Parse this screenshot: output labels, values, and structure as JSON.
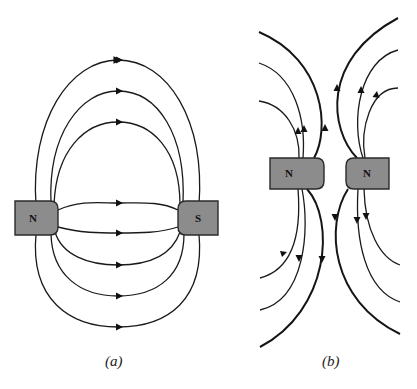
{
  "figure": {
    "panels": [
      {
        "id": "a",
        "caption": "(a)",
        "description": "Field lines between opposite poles",
        "magnets": [
          {
            "pole": "N",
            "x": 15,
            "y": 201,
            "w": 43,
            "h": 34
          },
          {
            "pole": "S",
            "x": 178,
            "y": 201,
            "w": 40,
            "h": 34
          }
        ],
        "field_line_count": 8,
        "arrow_direction": "N to S"
      },
      {
        "id": "b",
        "caption": "(b)",
        "description": "Field lines between like poles",
        "magnets": [
          {
            "pole": "N",
            "x": 270,
            "y": 158,
            "w": 54,
            "h": 31
          },
          {
            "pole": "N",
            "x": 346,
            "y": 158,
            "w": 43,
            "h": 31
          }
        ],
        "field_line_count": 12,
        "arrow_direction": "away from poles"
      }
    ],
    "colors": {
      "magnet_fill": "#8c8c8c",
      "line": "#1a1a1a",
      "background": "#ffffff"
    }
  }
}
